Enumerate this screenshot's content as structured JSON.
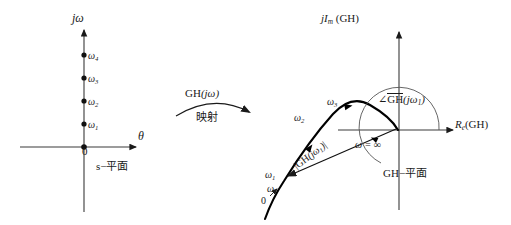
{
  "figure": {
    "title_hidden": "",
    "left_plane": {
      "name": "s-plane",
      "vertical_axis_label": "jω",
      "horizontal_axis_label": "θ",
      "origin_label": "0",
      "plane_label": "s−平面",
      "frequency_points": [
        {
          "label": "ω4",
          "base": "ω",
          "sub": "4",
          "x": 84,
          "y": 55
        },
        {
          "label": "ω3",
          "base": "ω",
          "sub": "3",
          "x": 84,
          "y": 78
        },
        {
          "label": "ω2",
          "base": "ω",
          "sub": "2",
          "x": 84,
          "y": 101
        },
        {
          "label": "ω1",
          "base": "ω",
          "sub": "1",
          "x": 84,
          "y": 124
        }
      ],
      "origin": {
        "x": 84,
        "y": 147
      }
    },
    "mapping": {
      "function_label": "GH",
      "function_arg": "(jω)",
      "chinese_label": "映射",
      "arrow": "curved-right"
    },
    "right_plane": {
      "name": "GH-plane",
      "vertical_axis_label_parts": {
        "j": "j",
        "I": "I",
        "m": "m",
        "gh": "(GH)"
      },
      "horizontal_axis_label_parts": {
        "R": "R",
        "e": "e",
        "gh": "(GH)"
      },
      "plane_label": "GH−平面",
      "omega_infinity_label": "ω = ∞",
      "angle_label": {
        "symbol": "∠",
        "gh": "GH",
        "arg_open": "(",
        "j": "j",
        "omega": "ω",
        "sub": "1",
        "arg_close": ")"
      },
      "magnitude_label": "|GH(jω1)|",
      "curve_points": [
        {
          "label": "ω1",
          "base": "ω",
          "sub": "1"
        },
        {
          "label": "ω2",
          "base": "ω",
          "sub": "2"
        },
        {
          "label": "ω3",
          "base": "ω",
          "sub": "3"
        },
        {
          "label": "ω",
          "base": "ω",
          "sub": ""
        },
        {
          "label": "0",
          "base": "0",
          "sub": ""
        }
      ],
      "origin": {
        "x": 399,
        "y": 130
      }
    },
    "colors": {
      "ink": "#1a1a1a",
      "axis": "#3a3a3a",
      "curve": "#000000",
      "background": "#ffffff"
    }
  }
}
